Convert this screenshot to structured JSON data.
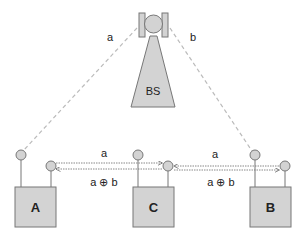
{
  "colors": {
    "fill": "#d3d3d3",
    "stroke": "#777777",
    "dashed_link": "#bbbbbb",
    "dotted_link": "#888888",
    "text": "#222222"
  },
  "base_station": {
    "label": "BS",
    "link_left_label": "a",
    "link_right_label": "b"
  },
  "nodes": [
    {
      "id": "A",
      "label": "A"
    },
    {
      "id": "C",
      "label": "C"
    },
    {
      "id": "B",
      "label": "B"
    }
  ],
  "links": {
    "A_C": {
      "top_label": "a",
      "bottom_label": "a ⊕ b"
    },
    "C_B": {
      "top_label": "a",
      "bottom_label": "a ⊕ b"
    }
  }
}
